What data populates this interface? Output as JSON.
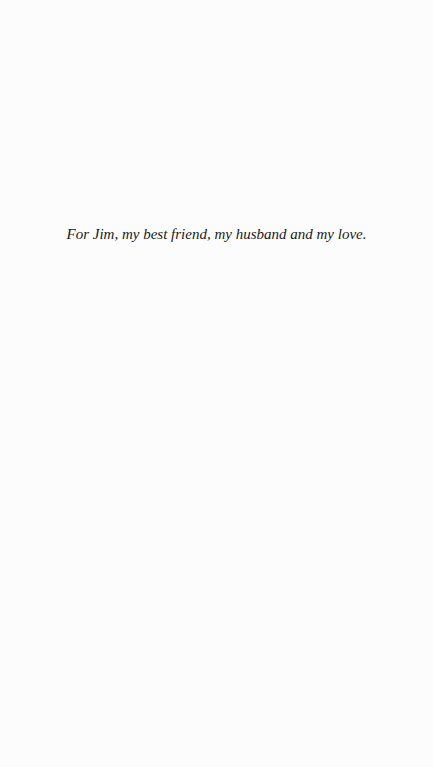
{
  "page": {
    "type": "dedication",
    "dedication_text": "For Jim, my best friend, my husband and my love."
  }
}
